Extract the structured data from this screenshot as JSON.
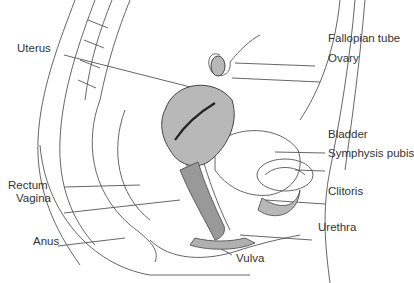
{
  "diagram": {
    "type": "anatomical-sagittal-section",
    "labels_left": [
      {
        "id": "uterus",
        "text": "Uterus"
      },
      {
        "id": "rectum",
        "text": "Rectum"
      },
      {
        "id": "vagina",
        "text": "Vagina"
      },
      {
        "id": "anus",
        "text": "Anus"
      }
    ],
    "labels_right": [
      {
        "id": "fallopian-tube",
        "text": "Fallopian tube"
      },
      {
        "id": "ovary",
        "text": "Ovary"
      },
      {
        "id": "bladder",
        "text": "Bladder"
      },
      {
        "id": "symphysis-pubis",
        "text": "Symphysis pubis"
      },
      {
        "id": "clitoris",
        "text": "Clitoris"
      },
      {
        "id": "urethra",
        "text": "Urethra"
      }
    ],
    "labels_bottom": [
      {
        "id": "vulva",
        "text": "Vulva"
      }
    ],
    "colors": {
      "line": "#555555",
      "organ_fill": "#b8b8b8",
      "text": "#333333"
    }
  }
}
